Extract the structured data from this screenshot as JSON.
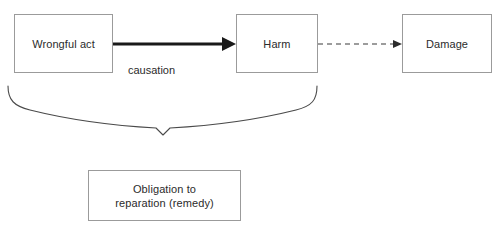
{
  "diagram": {
    "background_color": "#ffffff",
    "box_border_color": "#9b9b9b",
    "text_color": "#2b2b2b",
    "edge_color": "#4a4a4a",
    "nodes": [
      {
        "id": "wrongful_act",
        "label": "Wrongful act"
      },
      {
        "id": "harm",
        "label": "Harm"
      },
      {
        "id": "damage",
        "label": "Damage"
      },
      {
        "id": "obligation",
        "label": "Obligation to\nreparation (remedy)"
      }
    ],
    "edges": [
      {
        "id": "causation",
        "from": "wrongful_act",
        "to": "harm",
        "label": "causation",
        "style": "solid-thick",
        "arrowhead": "filled-triangle-large"
      },
      {
        "id": "harm_to_damage",
        "from": "harm",
        "to": "damage",
        "label": "",
        "style": "dashed-thin",
        "arrowhead": "filled-triangle-small"
      }
    ],
    "brace": {
      "id": "grouping-brace",
      "spans": [
        "wrongful_act",
        "harm"
      ],
      "points_to": "obligation",
      "orientation": "horizontal-down"
    },
    "caption": ""
  }
}
